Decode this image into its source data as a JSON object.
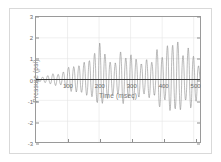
{
  "figure": {
    "background_color": "#ffffff",
    "frame_color": "#d9d9d9",
    "axis_color": "#9a9a9a",
    "grid_color": "#e3e3e3",
    "tick_text_color": "#6a6a6a",
    "label_text_color": "#7a7a7a"
  },
  "chart_data": {
    "type": "line",
    "title": "",
    "subtitle": "",
    "xlabel": "Time (msec)",
    "ylabel": "Pressure (psi)",
    "xlim": [
      0,
      520
    ],
    "ylim": [
      -3,
      3
    ],
    "xticks": [
      100,
      200,
      300,
      400,
      500
    ],
    "xticklabels": [
      "100",
      "200",
      "300",
      "400",
      "500"
    ],
    "yticks": [
      -3,
      -2,
      -1,
      0,
      1,
      2,
      3
    ],
    "yticklabels": [
      "-3",
      "-2",
      "-1",
      "0",
      "1",
      "2",
      "3"
    ],
    "grid": true,
    "grid_axes": "both",
    "legend": null,
    "legend_position": "none",
    "annotations": [],
    "series": [
      {
        "name": "Pressure oscillation",
        "color": "#8a8a8a",
        "linewidth": 0.6,
        "description": "Growing-amplitude pressure oscillation, roughly 60 Hz carrier, envelope rising from about 0.1 psi near t=0 to about 1.7 psi peak near t=470 msec, slightly asymmetric with negative troughs reaching about -1.5 psi",
        "envelope": {
          "t": [
            0,
            30,
            60,
            90,
            120,
            150,
            180,
            200,
            230,
            260,
            290,
            320,
            350,
            380,
            410,
            440,
            470,
            500,
            520
          ],
          "positive_peak": [
            0.05,
            0.12,
            0.25,
            0.45,
            0.62,
            0.78,
            0.92,
            1.55,
            1.05,
            1.1,
            1.18,
            0.95,
            1.05,
            1.12,
            1.3,
            1.72,
            1.35,
            1.48,
            0.6
          ],
          "negative_peak": [
            -0.05,
            -0.12,
            -0.22,
            -0.4,
            -0.55,
            -0.68,
            -0.8,
            -1.05,
            -0.9,
            -0.95,
            -1.0,
            -0.85,
            -0.92,
            -1.0,
            -1.15,
            -1.4,
            -1.2,
            -1.3,
            -1.5
          ]
        },
        "carrier_period_msec": 16.5
      }
    ]
  }
}
